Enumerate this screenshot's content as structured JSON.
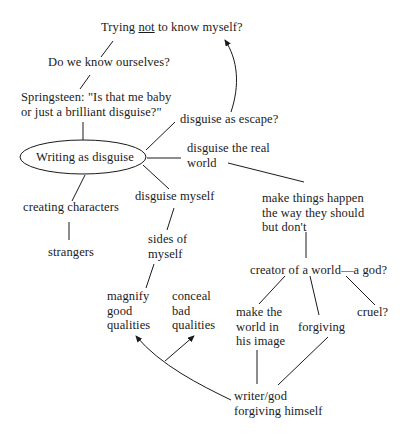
{
  "diagram": {
    "type": "mind-map",
    "central": {
      "label": "Writing as disguise"
    },
    "nodes": {
      "trying": {
        "before": "Trying ",
        "emph": "not",
        "after": " to know myself?"
      },
      "know": {
        "label": "Do we know ourselves?"
      },
      "springsteen": {
        "line1": "Springsteen: \"Is that me baby",
        "line2": "or just a brilliant disguise?\""
      },
      "escape": {
        "label": "disguise as escape?"
      },
      "real_world": {
        "line1": "disguise the real",
        "line2": "world"
      },
      "make_things": {
        "line1": "make things happen",
        "line2": "the way they should",
        "line3": "but don't"
      },
      "creating": {
        "label": "creating characters"
      },
      "strangers": {
        "label": "strangers"
      },
      "myself": {
        "label": "disguise myself"
      },
      "sides": {
        "line1": "sides of",
        "line2": "myself"
      },
      "magnify": {
        "line1": "magnify",
        "line2": "good",
        "line3": "qualities"
      },
      "conceal": {
        "line1": "conceal",
        "line2": "bad",
        "line3": "qualities"
      },
      "creator": {
        "label": "creator of a world—a god?"
      },
      "image": {
        "line1": "make the",
        "line2": "world in",
        "line3": "his image"
      },
      "forgiving": {
        "label": "forgiving"
      },
      "cruel": {
        "label": "cruel?"
      },
      "writer_god": {
        "line1": "writer/god",
        "line2": "forgiving himself"
      }
    },
    "edges": [
      [
        "Writing as disguise",
        "Springsteen quote"
      ],
      [
        "Springsteen quote",
        "Do we know ourselves?"
      ],
      [
        "Do we know ourselves?",
        "Trying not to know myself?"
      ],
      [
        "Writing as disguise",
        "disguise as escape?"
      ],
      [
        "disguise as escape?",
        "Trying not to know myself?",
        "arrow"
      ],
      [
        "Writing as disguise",
        "disguise the real world"
      ],
      [
        "disguise the real world",
        "make things happen the way they should but don't"
      ],
      [
        "make things happen the way they should but don't",
        "creator of a world—a god?"
      ],
      [
        "creator of a world—a god?",
        "make the world in his image"
      ],
      [
        "creator of a world—a god?",
        "forgiving"
      ],
      [
        "creator of a world—a god?",
        "cruel?"
      ],
      [
        "make the world in his image",
        "writer/god forgiving himself"
      ],
      [
        "forgiving",
        "writer/god forgiving himself"
      ],
      [
        "writer/god forgiving himself",
        "magnify good qualities",
        "arrow"
      ],
      [
        "writer/god forgiving himself",
        "conceal bad qualities",
        "arrow"
      ],
      [
        "Writing as disguise",
        "disguise myself"
      ],
      [
        "disguise myself",
        "sides of myself"
      ],
      [
        "sides of myself",
        "magnify good qualities"
      ],
      [
        "Writing as disguise",
        "creating characters"
      ],
      [
        "creating characters",
        "strangers"
      ]
    ],
    "colors": {
      "ink": "#1a1a1a",
      "background": "#ffffff"
    }
  }
}
